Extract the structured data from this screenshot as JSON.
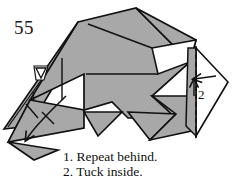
{
  "document": {
    "page_number": "55",
    "type": "origami instruction diagram"
  },
  "diagram": {
    "paper_fill_color": "#a8a8a8",
    "paper_back_color": "#ffffff",
    "line_color": "#111111",
    "labels": [
      {
        "id": "1",
        "text": "1",
        "refers_to": "Repeat behind."
      },
      {
        "id": "2",
        "text": "2",
        "refers_to": "Tuck inside."
      }
    ],
    "annotations": [
      {
        "name": "repeat-behind-arrow",
        "kind": "curved arrow with two hatch marks",
        "label": "1"
      },
      {
        "name": "tuck-inside-arrow",
        "kind": "straight arrow pointing left",
        "label": "2"
      },
      {
        "name": "sink-arrow",
        "kind": "small hollow arrowhead",
        "label": ""
      },
      {
        "name": "valley-fold-line",
        "kind": "dashed line",
        "label": ""
      }
    ]
  },
  "caption": {
    "lines": [
      "1. Repeat behind.",
      "2. Tuck inside."
    ],
    "line_1": "1. Repeat behind.",
    "line_2": "2. Tuck inside."
  }
}
